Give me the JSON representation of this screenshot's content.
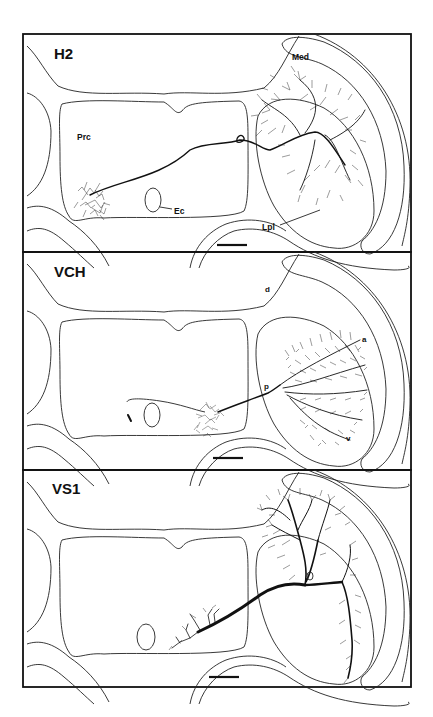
{
  "figure": {
    "panels": [
      {
        "id": "h2",
        "title": "H2",
        "labels": {
          "medulla": "Med",
          "protocerebrum": "Prc",
          "esophageal_canal": "Ec",
          "lobula_plate": "Lpl"
        },
        "has_scale_bar": true
      },
      {
        "id": "vch",
        "title": "VCH",
        "labels": {
          "dorsal": "d",
          "anterior": "a",
          "posterior": "p",
          "ventral": "v"
        },
        "has_scale_bar": true
      },
      {
        "id": "vs1",
        "title": "VS1",
        "labels": {},
        "has_scale_bar": true
      }
    ],
    "colors": {
      "ink": "#111111",
      "background": "#ffffff"
    }
  }
}
